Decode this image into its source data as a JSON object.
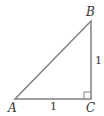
{
  "diagram": {
    "type": "right-triangle",
    "vertices": {
      "A": {
        "label": "A",
        "x": 15,
        "y": 99
      },
      "B": {
        "label": "B",
        "x": 91,
        "y": 21
      },
      "C": {
        "label": "C",
        "x": 91,
        "y": 99
      }
    },
    "sides": {
      "AC": {
        "label": "1"
      },
      "BC": {
        "label": "1"
      }
    },
    "right_angle_at": "C",
    "colors": {
      "line": "#808080",
      "text": "#333333"
    }
  }
}
